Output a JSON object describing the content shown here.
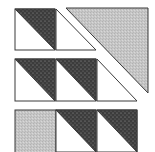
{
  "diagram": {
    "type": "quilt-block",
    "colors": {
      "background": "#ffffff",
      "outline": "#3a3a3a",
      "dark_fabric": "#3c3c3c",
      "dark_dot": "#9a9a9a",
      "light_fabric": "#c6c6c6",
      "white_fabric": "#ffffff"
    },
    "rows": [
      {
        "name": "row-1",
        "y": 9,
        "h": 41,
        "units": [
          {
            "kind": "half-square-triangle",
            "x": 15,
            "w": 40,
            "dark": "upper-right",
            "light": "lower-left"
          },
          {
            "kind": "white-triangle",
            "x": 56,
            "w": 40
          }
        ]
      },
      {
        "name": "row-2",
        "y": 59,
        "h": 42,
        "units": [
          {
            "kind": "half-square-triangle",
            "x": 15,
            "w": 40,
            "dark": "upper-right",
            "light": "lower-left"
          },
          {
            "kind": "half-square-triangle",
            "x": 56,
            "w": 40,
            "dark": "upper-right",
            "light": "lower-left"
          },
          {
            "kind": "white-triangle",
            "x": 97,
            "w": 40
          }
        ]
      },
      {
        "name": "row-3",
        "y": 110,
        "h": 42,
        "units": [
          {
            "kind": "light-square",
            "x": 15,
            "w": 41
          },
          {
            "kind": "half-square-triangle",
            "x": 56,
            "w": 40,
            "dark": "upper-right",
            "light": "lower-left"
          },
          {
            "kind": "half-square-triangle",
            "x": 97,
            "w": 40,
            "dark": "upper-right",
            "light": "lower-left"
          }
        ]
      }
    ],
    "large_triangle": {
      "points": [
        [
          66,
          8
        ],
        [
          148,
          8
        ],
        [
          148,
          93
        ]
      ],
      "fill": "light"
    }
  }
}
